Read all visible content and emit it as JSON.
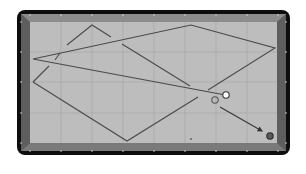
{
  "diagram": {
    "type": "billiards-table-shot-diagram",
    "colors": {
      "background": "#ffffff",
      "frame": "#0d0d0d",
      "rail_outer": "#6e6e6e",
      "rail_inner": "#8c8c8c",
      "cloth": "#bdbdbd",
      "grid": "#a6a6a6",
      "path_line": "#4a4a4a",
      "diamond": "#d8d8d8",
      "cue_ball": "#ffffff",
      "ghost_ball_stroke": "#555555",
      "object_ball": "#5a5a5a",
      "arrow": "#333333"
    },
    "frame": {
      "x": 17,
      "y": 10,
      "w": 273,
      "h": 145,
      "radius": 8
    },
    "cloth": {
      "x": 30,
      "y": 22,
      "w": 247,
      "h": 121
    },
    "grid": {
      "vertical_x": [
        61,
        92,
        123,
        154,
        185,
        216,
        247
      ],
      "horizontal_y": [
        52,
        82,
        113
      ]
    },
    "diamonds": {
      "top": [
        [
          30,
          15
        ],
        [
          61,
          15
        ],
        [
          92,
          15
        ],
        [
          123,
          15
        ],
        [
          154,
          15
        ],
        [
          185,
          15
        ],
        [
          216,
          15
        ],
        [
          247,
          15
        ],
        [
          278,
          15
        ]
      ],
      "bottom": [
        [
          30,
          151
        ],
        [
          61,
          151
        ],
        [
          92,
          151
        ],
        [
          123,
          151
        ],
        [
          154,
          151
        ],
        [
          185,
          151
        ],
        [
          216,
          151
        ],
        [
          247,
          151
        ],
        [
          278,
          151
        ]
      ],
      "left": [
        [
          21,
          22
        ],
        [
          21,
          52
        ],
        [
          21,
          82
        ],
        [
          21,
          113
        ],
        [
          21,
          143
        ]
      ],
      "right": [
        [
          286,
          22
        ],
        [
          286,
          52
        ],
        [
          286,
          82
        ],
        [
          286,
          113
        ],
        [
          286,
          143
        ]
      ]
    },
    "paths": [
      {
        "name": "cue-ball-path-main",
        "points": [
          [
            226,
            95
          ],
          [
            220,
            94
          ],
          [
            33,
            59
          ],
          [
            191,
            25
          ],
          [
            275,
            48
          ],
          [
            208,
            90
          ]
        ]
      },
      {
        "name": "path-segment-upper-left",
        "points": [
          [
            67,
            45
          ],
          [
            92,
            25
          ],
          [
            111,
            37
          ]
        ]
      },
      {
        "name": "path-segment-left-dash-1",
        "points": [
          [
            55,
            60
          ],
          [
            60,
            53
          ]
        ]
      },
      {
        "name": "path-segment-left-dash-2",
        "points": [
          [
            33,
            82
          ],
          [
            49,
            66
          ]
        ]
      },
      {
        "name": "path-segment-diagonal-mid",
        "points": [
          [
            122,
            44
          ],
          [
            190,
            86
          ]
        ]
      },
      {
        "name": "path-segment-lower",
        "points": [
          [
            33,
            82
          ],
          [
            127,
            141
          ],
          [
            198,
            97
          ]
        ]
      }
    ],
    "balls": [
      {
        "name": "cue-ball",
        "cx": 226,
        "cy": 95,
        "r": 3.2,
        "fill": "#ffffff",
        "stroke": "#333333"
      },
      {
        "name": "ghost-ball",
        "cx": 215,
        "cy": 100,
        "r": 3.2,
        "fill": "none",
        "stroke": "#555555"
      },
      {
        "name": "object-ball",
        "cx": 270,
        "cy": 136,
        "r": 3.2,
        "fill": "#5a5a5a",
        "stroke": "#2a2a2a"
      }
    ],
    "arrow": {
      "x1": 220,
      "y1": 107,
      "x2": 262,
      "y2": 131
    },
    "marker_dot": {
      "cx": 191,
      "cy": 139,
      "r": 0.9
    }
  }
}
